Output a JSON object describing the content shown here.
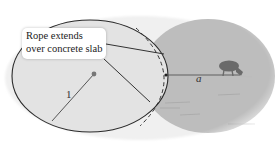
{
  "figure": {
    "callout": {
      "line1": "Rope extends",
      "line2": "over concrete slab"
    },
    "labels": {
      "radius": "1",
      "rope_length": "a"
    },
    "shapes": {
      "slab": {
        "shape": "ellipse",
        "fill": "#e2e2e2",
        "stroke": "#2a2a2a"
      },
      "grazing_area": {
        "shape": "circle",
        "fill": "#b9b9b9"
      },
      "background": "#ffffff"
    },
    "icons": {
      "animal": "goat-icon",
      "center": "center-dot-icon"
    }
  }
}
